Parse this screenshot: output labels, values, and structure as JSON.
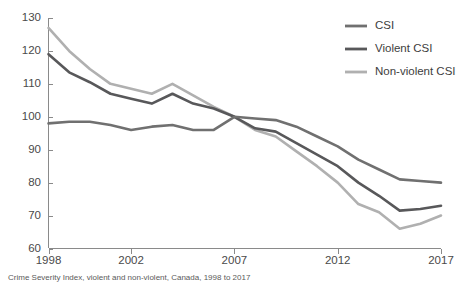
{
  "chart_data": {
    "type": "line",
    "title": "",
    "xlabel": "",
    "ylabel": "",
    "xlim": [
      1998,
      2017
    ],
    "ylim": [
      60,
      130
    ],
    "grid": false,
    "legend_position": "top-right",
    "x": [
      1998,
      1999,
      2000,
      2001,
      2002,
      2003,
      2004,
      2005,
      2006,
      2007,
      2008,
      2009,
      2010,
      2011,
      2012,
      2013,
      2014,
      2015,
      2016,
      2017
    ],
    "xticks": [
      "1998",
      "2002",
      "2007",
      "2012",
      "2017"
    ],
    "xtick_values": [
      1998,
      2002,
      2007,
      2012,
      2017
    ],
    "yticks": [
      "60",
      "70",
      "80",
      "90",
      "100",
      "110",
      "120",
      "130"
    ],
    "ytick_values": [
      60,
      70,
      80,
      90,
      100,
      110,
      120,
      130
    ],
    "series": [
      {
        "name": "CSI",
        "color": "#707070",
        "values": [
          98,
          98.5,
          98.5,
          97.5,
          96,
          97,
          97.5,
          96,
          96,
          100,
          99.5,
          99,
          97,
          94,
          91,
          87,
          84,
          81,
          80.5,
          80
        ]
      },
      {
        "name": "Violent CSI",
        "color": "#58585a",
        "values": [
          119,
          113.5,
          110.5,
          107,
          105.5,
          104,
          107,
          104,
          102.5,
          100,
          96.5,
          95.5,
          92,
          88.5,
          85,
          80,
          76,
          71.5,
          72,
          73
        ]
      },
      {
        "name": "Non-violent CSI",
        "color": "#b0b0b0",
        "values": [
          127,
          120,
          114.5,
          110,
          108.5,
          107,
          110,
          106.5,
          103,
          100,
          96,
          94,
          89.5,
          85,
          80,
          73.5,
          71,
          66,
          67.5,
          70
        ]
      }
    ],
    "annotations": []
  },
  "legend": {
    "items": [
      {
        "label": "CSI",
        "color": "#707070"
      },
      {
        "label": "Violent CSI",
        "color": "#58585a"
      },
      {
        "label": "Non-violent CSI",
        "color": "#b0b0b0"
      }
    ]
  },
  "axes": {
    "y_axis_name": "index-value-axis",
    "x_axis_name": "year-axis"
  },
  "footnote": {
    "text": "Crime Severity Index, violent and non-violent, Canada, 1998 to 2017"
  }
}
